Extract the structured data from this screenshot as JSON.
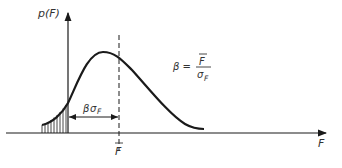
{
  "diagram": {
    "y_axis_label": "p(F)",
    "x_axis_label": "F",
    "mean_label": "F",
    "margin_label": {
      "beta": "β",
      "sigma": "σ",
      "subscript": "F"
    },
    "formula": {
      "lhs": "β =",
      "numerator": "F",
      "denominator": "σ",
      "denominator_subscript": "F"
    },
    "colors": {
      "ink": "#1a1a1a",
      "text": "#333333",
      "background": "#ffffff"
    }
  }
}
